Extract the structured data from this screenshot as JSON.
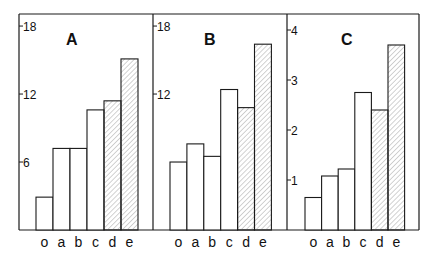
{
  "chart_data": [
    {
      "type": "bar",
      "title": "A",
      "categories": [
        "o",
        "a",
        "b",
        "c",
        "d",
        "e"
      ],
      "values": [
        2.9,
        7.2,
        7.2,
        10.6,
        11.4,
        15.1
      ],
      "hatched": [
        false,
        false,
        false,
        false,
        true,
        true
      ],
      "yticks": [
        6,
        12,
        18
      ],
      "ylim": [
        0,
        19
      ],
      "xlabel": "",
      "ylabel": "",
      "grid": false
    },
    {
      "type": "bar",
      "title": "B",
      "categories": [
        "o",
        "a",
        "b",
        "c",
        "d",
        "e"
      ],
      "values": [
        6.0,
        7.6,
        6.5,
        12.4,
        10.8,
        16.4
      ],
      "hatched": [
        false,
        false,
        false,
        false,
        true,
        true
      ],
      "yticks": [
        12,
        18
      ],
      "ylim": [
        0,
        19
      ],
      "xlabel": "",
      "ylabel": "",
      "grid": false
    },
    {
      "type": "bar",
      "title": "C",
      "categories": [
        "o",
        "a",
        "b",
        "c",
        "d",
        "e"
      ],
      "values": [
        0.65,
        1.08,
        1.22,
        2.75,
        2.4,
        3.7
      ],
      "hatched": [
        false,
        false,
        false,
        false,
        true,
        true
      ],
      "yticks": [
        1,
        2,
        3,
        4
      ],
      "ylim": [
        0,
        4.3
      ],
      "xlabel": "",
      "ylabel": "",
      "grid": false
    }
  ],
  "colors": {
    "stroke": "#1a1a1a",
    "hatch": "#9a9a9a",
    "background": "#ffffff"
  }
}
